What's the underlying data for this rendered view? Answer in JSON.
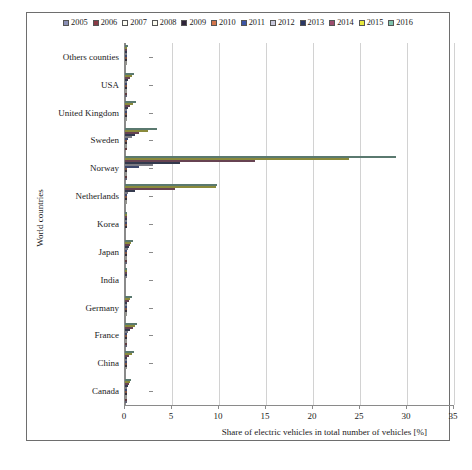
{
  "chart_data": {
    "type": "bar",
    "orientation": "horizontal",
    "title": "",
    "xlabel": "Share of electric vehicles in total number of vehicles [%]",
    "ylabel": "World countries",
    "xlim": [
      0,
      35
    ],
    "xticks": [
      0,
      5,
      10,
      15,
      20,
      25,
      30,
      35
    ],
    "grid": true,
    "legend_position": "top",
    "categories": [
      "Others counties",
      "USA",
      "United Kingdom",
      "Sweden",
      "Norway",
      "Netherlands",
      "Korea",
      "Japan",
      "India",
      "Germany",
      "France",
      "China",
      "Canada"
    ],
    "series": [
      {
        "name": "2005",
        "color": "#8a8fb5",
        "values": [
          0.0,
          0.01,
          0.0,
          0.0,
          0.02,
          0.0,
          0.0,
          0.02,
          0.0,
          0.0,
          0.01,
          0.0,
          0.01
        ]
      },
      {
        "name": "2006",
        "color": "#8a3a45",
        "values": [
          0.0,
          0.02,
          0.0,
          0.01,
          0.03,
          0.0,
          0.0,
          0.03,
          0.0,
          0.0,
          0.02,
          0.0,
          0.01
        ]
      },
      {
        "name": "2007",
        "color": "#fdfdf4",
        "values": [
          0.01,
          0.03,
          0.01,
          0.02,
          0.05,
          0.01,
          0.0,
          0.04,
          0.0,
          0.01,
          0.03,
          0.0,
          0.02
        ]
      },
      {
        "name": "2008",
        "color": "#fbfbf0",
        "values": [
          0.01,
          0.04,
          0.02,
          0.04,
          0.09,
          0.01,
          0.0,
          0.06,
          0.0,
          0.01,
          0.05,
          0.01,
          0.03
        ]
      },
      {
        "name": "2009",
        "color": "#2e2338",
        "values": [
          0.02,
          0.06,
          0.03,
          0.07,
          0.15,
          0.02,
          0.01,
          0.09,
          0.0,
          0.02,
          0.08,
          0.01,
          0.05
        ]
      },
      {
        "name": "2010",
        "color": "#d4754b",
        "values": [
          0.03,
          0.09,
          0.05,
          0.12,
          0.25,
          0.04,
          0.01,
          0.13,
          0.0,
          0.04,
          0.12,
          0.02,
          0.08
        ]
      },
      {
        "name": "2011",
        "color": "#3d55a6",
        "values": [
          0.05,
          0.14,
          0.1,
          0.3,
          1.5,
          0.1,
          0.02,
          0.2,
          0.0,
          0.08,
          0.2,
          0.04,
          0.12
        ]
      },
      {
        "name": "2012",
        "color": "#c8c8dc",
        "values": [
          0.08,
          0.22,
          0.18,
          0.7,
          3.0,
          0.35,
          0.03,
          0.3,
          0.01,
          0.15,
          0.35,
          0.08,
          0.2
        ]
      },
      {
        "name": "2013",
        "color": "#2b3864",
        "values": [
          0.12,
          0.34,
          0.3,
          1.1,
          5.8,
          1.1,
          0.04,
          0.42,
          0.01,
          0.25,
          0.55,
          0.18,
          0.3
        ]
      },
      {
        "name": "2014",
        "color": "#9c4d6e",
        "values": [
          0.18,
          0.52,
          0.55,
          1.5,
          13.8,
          5.3,
          0.06,
          0.55,
          0.01,
          0.38,
          0.8,
          0.4,
          0.42
        ]
      },
      {
        "name": "2015",
        "color": "#e8e83c",
        "values": [
          0.26,
          0.72,
          0.9,
          2.4,
          23.8,
          9.7,
          0.08,
          0.68,
          0.02,
          0.55,
          1.05,
          0.7,
          0.52
        ]
      },
      {
        "name": "2016",
        "color": "#7fc3ad",
        "values": [
          0.34,
          0.92,
          1.2,
          3.4,
          28.8,
          9.8,
          0.1,
          0.8,
          0.02,
          0.72,
          1.25,
          1.0,
          0.62
        ]
      }
    ]
  },
  "figure": {
    "caption": ""
  }
}
